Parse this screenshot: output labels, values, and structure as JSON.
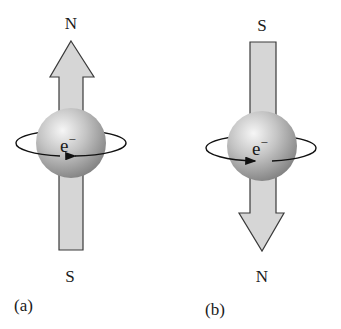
{
  "panels": [
    {
      "id": "a",
      "caption": "(a)",
      "top_label": "N",
      "bottom_label": "S",
      "arrow_direction": "up",
      "particle_label": "e",
      "particle_charge": "−",
      "spin_direction": "counterclockwise-front-leftward"
    },
    {
      "id": "b",
      "caption": "(b)",
      "top_label": "S",
      "bottom_label": "N",
      "arrow_direction": "down",
      "particle_label": "e",
      "particle_charge": "−",
      "spin_direction": "clockwise-front-rightward"
    }
  ],
  "colors": {
    "arrow_fill": "#d6d6d6",
    "arrow_stroke": "#3a3a3a",
    "sphere_light": "#f4f4f4",
    "sphere_mid": "#b5b5b5",
    "sphere_dark": "#7a7a7a",
    "text": "#1a1a1a"
  }
}
